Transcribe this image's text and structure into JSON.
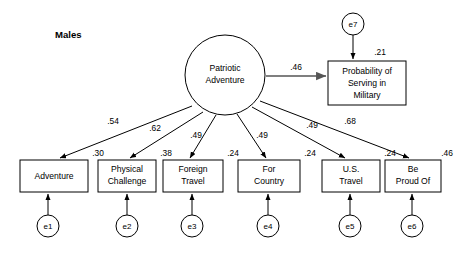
{
  "diagram": {
    "title": "Males",
    "type": "structural-equation-model-path-diagram",
    "latent": {
      "id": "patriotic-adventure",
      "label_line1": "Patriotic",
      "label_line2": "Adventure",
      "shape": "circle",
      "cx": 225,
      "cy": 75,
      "r": 40
    },
    "outcome": {
      "id": "probability-serving-military",
      "label_line1": "Probability of",
      "label_line2": "Serving in",
      "label_line3": "Military",
      "variance": ".21",
      "shape": "rect",
      "x": 328,
      "y": 61,
      "w": 78,
      "h": 44
    },
    "structural_path": {
      "from": "patriotic-adventure",
      "to": "probability-serving-military",
      "coefficient": ".46"
    },
    "outcome_error": {
      "id": "e7",
      "label": "e7",
      "cx": 353,
      "cy": 24,
      "r": 11
    },
    "indicators": [
      {
        "id": "adventure",
        "label_line1": "Adventure",
        "label_line2": "",
        "loading": ".54",
        "variance": ".30",
        "error_label": "e1",
        "x": 20,
        "y": 160,
        "w": 68,
        "h": 32,
        "err_cx": 48,
        "err_cy": 226,
        "loading_x": 113,
        "loading_y": 122,
        "var_x": 98,
        "var_y": 154
      },
      {
        "id": "physical-challenge",
        "label_line1": "Physical",
        "label_line2": "Challenge",
        "loading": ".62",
        "variance": ".38",
        "error_label": "e2",
        "x": 98,
        "y": 160,
        "w": 58,
        "h": 32,
        "err_cx": 127,
        "err_cy": 226,
        "loading_x": 155,
        "loading_y": 129,
        "var_x": 166,
        "var_y": 154
      },
      {
        "id": "foreign-travel",
        "label_line1": "Foreign",
        "label_line2": "Travel",
        "loading": ".49",
        "variance": ".24",
        "error_label": "e3",
        "x": 163,
        "y": 160,
        "w": 60,
        "h": 32,
        "err_cx": 192,
        "err_cy": 226,
        "loading_x": 196,
        "loading_y": 136,
        "var_x": 233,
        "var_y": 154
      },
      {
        "id": "for-country",
        "label_line1": "For",
        "label_line2": "Country",
        "loading": ".49",
        "variance": ".24",
        "error_label": "e4",
        "x": 238,
        "y": 160,
        "w": 62,
        "h": 32,
        "err_cx": 268,
        "err_cy": 226,
        "loading_x": 262,
        "loading_y": 136,
        "var_x": 310,
        "var_y": 154
      },
      {
        "id": "us-travel",
        "label_line1": "U.S.",
        "label_line2": "Travel",
        "loading": ".49",
        "variance": ".24",
        "error_label": "e5",
        "x": 322,
        "y": 160,
        "w": 58,
        "h": 32,
        "err_cx": 350,
        "err_cy": 226,
        "loading_x": 312,
        "loading_y": 126,
        "var_x": 390,
        "var_y": 154
      },
      {
        "id": "be-proud-of",
        "label_line1": "Be",
        "label_line2": "Proud Of",
        "loading": ".68",
        "variance": ".46",
        "error_label": "e6",
        "x": 385,
        "y": 160,
        "w": 56,
        "h": 32,
        "err_cx": 412,
        "err_cy": 226,
        "loading_x": 350,
        "loading_y": 122,
        "var_x": 447,
        "var_y": 154
      }
    ]
  }
}
